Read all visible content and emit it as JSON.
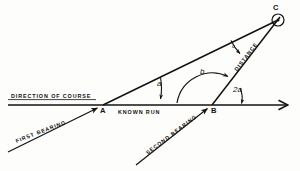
{
  "figure": {
    "stroke_color": "#121212",
    "background_color": "#fdfdfc"
  },
  "labels": {
    "direction_of_course": "DIRECTION OF COURSE",
    "first_bearing": "FIRST BEARING",
    "second_bearing": "SECOND BEARING",
    "known_run": "KNOWN RUN",
    "distance": "DISTANCE"
  },
  "points": {
    "a": "A",
    "b": "B",
    "c": "C"
  },
  "angles": {
    "at_a": "a",
    "at_b": "b",
    "at_c": "c",
    "exterior_at_b": "2a"
  },
  "geometry": {
    "point_a": [
      103,
      105
    ],
    "point_b": [
      212,
      105
    ],
    "point_c": [
      278,
      20
    ],
    "course_line_start": [
      8,
      105
    ],
    "course_line_end": [
      293,
      105
    ],
    "first_bearing_start": [
      8,
      152
    ],
    "first_bearing_end": [
      99,
      108
    ],
    "second_bearing_start": [
      136,
      165
    ],
    "second_bearing_end": [
      208,
      108
    ],
    "target_circle_center": [
      278,
      20
    ],
    "target_circle_radius": 6
  }
}
